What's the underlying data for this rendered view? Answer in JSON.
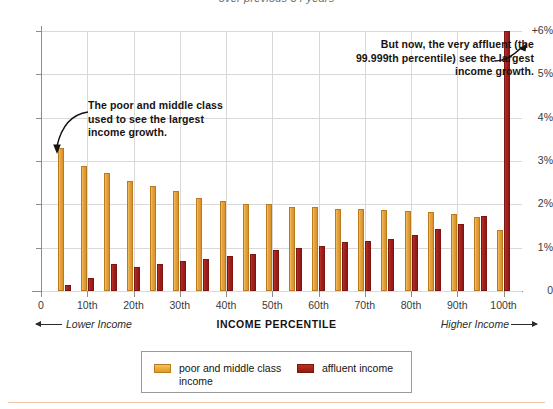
{
  "subtitle": "over previous 34 years",
  "annotations": {
    "left": "The poor and middle class used to see the largest income growth.",
    "right": "But now, the very affluent (the 99.999th percentile) see the largest income growth."
  },
  "axis_captions": {
    "lower": "Lower Income",
    "center": "INCOME PERCENTILE",
    "higher": "Higher Income"
  },
  "legend": {
    "items": [
      {
        "label": "poor and middle class income",
        "color": "#E8A33D"
      },
      {
        "label": "affluent income",
        "color": "#A32020"
      }
    ]
  },
  "colors": {
    "poor": "#E8A33D",
    "affluent": "#A32020",
    "grid": "#D9D9D9",
    "axis": "#8C8C8C",
    "text": "#231F20",
    "rule": "#F0C8A8"
  },
  "chart_data": {
    "type": "bar",
    "title": "",
    "subtitle": "over previous 34 years",
    "xlabel": "INCOME PERCENTILE",
    "ylabel": "",
    "ylim": [
      0,
      6
    ],
    "yticks": [
      0,
      1,
      2,
      3,
      4,
      5,
      6
    ],
    "ytick_labels": [
      "0",
      "1%",
      "2%",
      "3%",
      "4%",
      "5%",
      "+6%"
    ],
    "xticks": [
      0,
      10,
      20,
      30,
      40,
      50,
      60,
      70,
      80,
      90,
      100
    ],
    "xtick_labels": [
      "0",
      "10th",
      "20th",
      "30th",
      "40th",
      "50th",
      "60th",
      "70th",
      "80th",
      "90th",
      "100th"
    ],
    "grid": true,
    "legend_position": "bottom",
    "categories": [
      "5th",
      "10th",
      "15th",
      "20th",
      "25th",
      "30th",
      "35th",
      "40th",
      "45th",
      "50th",
      "55th",
      "60th",
      "65th",
      "70th",
      "75th",
      "80th",
      "85th",
      "90th",
      "95th",
      "100th"
    ],
    "x_positions": [
      5,
      10,
      15,
      20,
      25,
      30,
      35,
      40,
      45,
      50,
      55,
      60,
      65,
      70,
      75,
      80,
      85,
      90,
      95,
      100
    ],
    "series": [
      {
        "name": "poor and middle class income",
        "color": "#E8A33D",
        "values": [
          3.3,
          2.88,
          2.72,
          2.55,
          2.43,
          2.3,
          2.15,
          2.07,
          2.0,
          2.0,
          1.95,
          1.93,
          1.9,
          1.9,
          1.88,
          1.85,
          1.82,
          1.78,
          1.7,
          1.4
        ]
      },
      {
        "name": "affluent income",
        "color": "#A32020",
        "values": [
          0.15,
          0.3,
          0.62,
          0.55,
          0.62,
          0.7,
          0.75,
          0.8,
          0.86,
          0.95,
          1.0,
          1.05,
          1.12,
          1.15,
          1.2,
          1.3,
          1.42,
          1.55,
          1.72,
          6.0
        ]
      }
    ]
  }
}
